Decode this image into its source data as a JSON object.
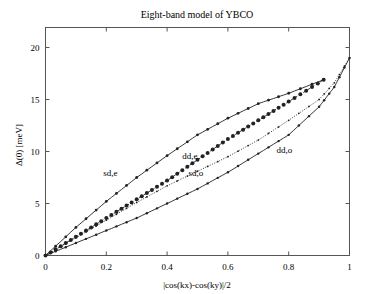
{
  "chart_data": {
    "type": "line",
    "title": "Eight-band model of YBCO",
    "xlabel": "|cos(kx)-cos(ky)|/2",
    "ylabel": "Δ(0) [meV]",
    "xlim": [
      0,
      1
    ],
    "ylim": [
      0,
      22
    ],
    "grid": false,
    "legend": "inline labels",
    "x_ticks": [
      "0",
      "0.2",
      "0.4",
      "0.6",
      "0.8",
      "1"
    ],
    "y_ticks": [
      "0",
      "5",
      "10",
      "15",
      "20"
    ],
    "series": [
      {
        "name": "sd,e",
        "marker": "small dot",
        "style": "solid",
        "x": [
          0,
          0.1,
          0.2,
          0.3,
          0.4,
          0.5,
          0.6,
          0.7,
          0.8,
          0.915
        ],
        "values": [
          0,
          2.7,
          5.2,
          7.5,
          9.6,
          11.6,
          13.2,
          14.6,
          15.6,
          16.9
        ]
      },
      {
        "name": "dd,e",
        "marker": "large dot",
        "style": "dashed",
        "x": [
          0,
          0.1,
          0.2,
          0.3,
          0.4,
          0.5,
          0.6,
          0.7,
          0.8,
          0.915
        ],
        "values": [
          0,
          1.8,
          3.6,
          5.4,
          7.2,
          9.2,
          11.2,
          13.0,
          14.8,
          16.9
        ]
      },
      {
        "name": "sd,o",
        "marker": "tiny dot",
        "style": "dotted",
        "x": [
          0,
          0.1,
          0.2,
          0.3,
          0.4,
          0.5,
          0.6,
          0.7,
          0.8,
          0.9,
          0.95,
          1.0
        ],
        "values": [
          0,
          1.7,
          3.4,
          5.1,
          6.7,
          8.1,
          9.5,
          11.1,
          13.0,
          15.0,
          16.6,
          19.0
        ]
      },
      {
        "name": "dd,o",
        "marker": "small dot",
        "style": "solid",
        "x": [
          0,
          0.1,
          0.2,
          0.3,
          0.4,
          0.5,
          0.6,
          0.7,
          0.8,
          0.9,
          0.95,
          1.0
        ],
        "values": [
          0,
          1.2,
          2.4,
          3.6,
          5.0,
          6.4,
          8.0,
          9.8,
          11.6,
          14.3,
          16.2,
          19.0
        ]
      }
    ],
    "annotations": [
      {
        "text": "sd,e",
        "x": 0.19,
        "y": 7.6
      },
      {
        "text": "dd,e",
        "x": 0.45,
        "y": 9.3
      },
      {
        "text": "sd,o",
        "x": 0.47,
        "y": 7.6
      },
      {
        "text": "dd,o",
        "x": 0.76,
        "y": 9.9
      }
    ]
  }
}
